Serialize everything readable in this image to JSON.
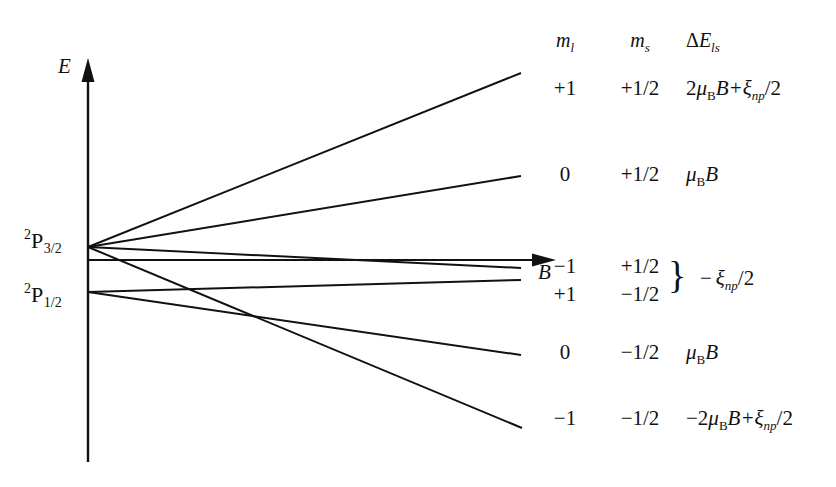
{
  "figure": {
    "axes": {
      "vertical_label": "E",
      "horizontal_label": "B"
    },
    "levels": [
      {
        "name": "2P3/2",
        "pre_superscript": "2",
        "letter": "P",
        "subscript": "3/2"
      },
      {
        "name": "2P1/2",
        "pre_superscript": "2",
        "letter": "P",
        "subscript": "1/2"
      }
    ],
    "columns": {
      "ml_header_base": "m",
      "ml_header_sub": "l",
      "ms_header_base": "m",
      "ms_header_sub": "s",
      "de_header_delta": "Δ",
      "de_header_base": "E",
      "de_header_sub": "ls"
    },
    "rows": [
      {
        "ml": "+1",
        "ms": "+1/2",
        "energy_prefix": "2",
        "energy_mu": "μ",
        "energy_mu_sub": "B",
        "energy_mid": "B+",
        "energy_xi": "ξ",
        "energy_xi_sub": "np",
        "energy_suffix": "/2",
        "energy_plain": "2μ_B B + ξ_np/2",
        "braced": false
      },
      {
        "ml": "0",
        "ms": "+1/2",
        "energy_prefix": "",
        "energy_mu": "μ",
        "energy_mu_sub": "B",
        "energy_mid": "B",
        "energy_xi": "",
        "energy_xi_sub": "",
        "energy_suffix": "",
        "energy_plain": "μ_B B",
        "braced": false
      },
      {
        "ml": "−1",
        "ms": "+1/2",
        "energy_prefix": "",
        "energy_mu": "",
        "energy_mu_sub": "",
        "energy_mid": "",
        "energy_xi": "",
        "energy_xi_sub": "",
        "energy_suffix": "",
        "energy_plain": "",
        "braced": true
      },
      {
        "ml": "+1",
        "ms": "−1/2",
        "energy_prefix": "",
        "energy_mu": "",
        "energy_mu_sub": "",
        "energy_mid": "",
        "energy_xi": "",
        "energy_xi_sub": "",
        "energy_suffix": "",
        "energy_plain": "",
        "braced": true
      },
      {
        "ml": "0",
        "ms": "−1/2",
        "energy_prefix": "",
        "energy_mu": "μ",
        "energy_mu_sub": "B",
        "energy_mid": "B",
        "energy_xi": "",
        "energy_xi_sub": "",
        "energy_suffix": "",
        "energy_plain": "μ_B B",
        "braced": false
      },
      {
        "ml": "−1",
        "ms": "−1/2",
        "energy_prefix": "−2",
        "energy_mu": "μ",
        "energy_mu_sub": "B",
        "energy_mid": "B+",
        "energy_xi": "ξ",
        "energy_xi_sub": "np",
        "energy_suffix": "/2",
        "energy_plain": "−2μ_B B + ξ_np/2",
        "braced": false
      }
    ],
    "brace": {
      "glyph": "}",
      "energy_minus": "−",
      "energy_xi": "ξ",
      "energy_xi_sub": "np",
      "energy_suffix": "/2",
      "energy_plain": "−ξ_np/2"
    },
    "colors": {
      "ink": "#111111",
      "background": "#ffffff"
    }
  }
}
